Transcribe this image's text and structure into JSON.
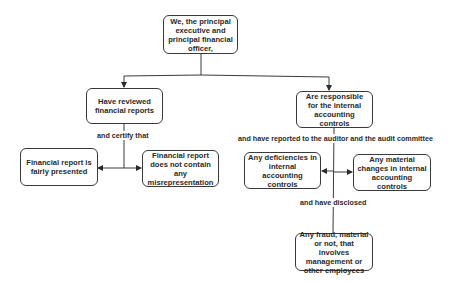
{
  "diagram": {
    "type": "flowchart",
    "line_color": "#3a3a3a",
    "background": "#ffffff",
    "nodes": {
      "root": {
        "text": "We, the principal executive and principal financial officer,"
      },
      "reviewed": {
        "text": "Have reviewed financial reports"
      },
      "responsible": {
        "text": "Are responsible for the internal accounting controls"
      },
      "fairly_presented": {
        "text": "Financial report is fairly presented"
      },
      "no_misrepresentation": {
        "text": "Financial report does not contain any misrepresentation"
      },
      "deficiencies": {
        "text": "Any deficiencies in internal accounting controls"
      },
      "material_changes": {
        "text": "Any material changes in internal accounting controls"
      },
      "fraud": {
        "text": "Any fraud, material or not, that involves management or other employees"
      }
    },
    "edge_labels": {
      "certify": "and certify that",
      "reported": "and have reported to the auditor and the audit committee",
      "disclosed": "and have disclosed"
    },
    "edges": [
      {
        "from": "root",
        "to": "reviewed"
      },
      {
        "from": "root",
        "to": "responsible"
      },
      {
        "from": "reviewed",
        "to": "fairly_presented",
        "label": "and certify that"
      },
      {
        "from": "reviewed",
        "to": "no_misrepresentation",
        "label": "and certify that"
      },
      {
        "from": "responsible",
        "to": "deficiencies",
        "label": "and have reported to the auditor and the audit committee"
      },
      {
        "from": "responsible",
        "to": "material_changes",
        "label": "and have reported to the auditor and the audit committee"
      },
      {
        "from": "responsible",
        "to": "fraud",
        "label": "and have disclosed"
      }
    ]
  }
}
